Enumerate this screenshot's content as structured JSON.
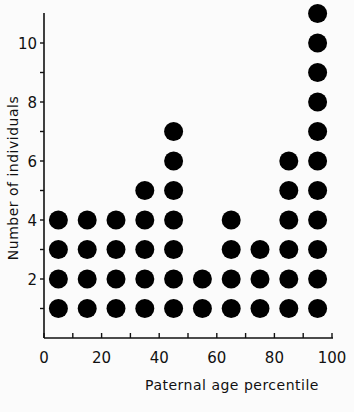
{
  "chart_data": {
    "type": "scatter",
    "style": "dot-stack",
    "title": "",
    "xlabel": "Paternal age percentile",
    "ylabel": "Number of individuals",
    "xlim": [
      0,
      100
    ],
    "ylim": [
      0,
      11
    ],
    "x_ticks": [
      0,
      20,
      40,
      60,
      80,
      100
    ],
    "x_minor_ticks": [
      10,
      30,
      50,
      70,
      90
    ],
    "y_ticks": [
      2,
      4,
      6,
      8,
      10
    ],
    "y_minor_ticks": [
      1,
      3,
      5,
      7,
      9
    ],
    "grid": false,
    "legend": null,
    "categories": [
      "0-10",
      "10-20",
      "20-30",
      "30-40",
      "40-50",
      "50-60",
      "60-70",
      "70-80",
      "80-90",
      "90-100"
    ],
    "x": [
      5,
      15,
      25,
      35,
      45,
      55,
      65,
      75,
      85,
      95
    ],
    "values": [
      4,
      4,
      4,
      5,
      7,
      2,
      4,
      3,
      6,
      11
    ],
    "marker_color": "#000000"
  }
}
